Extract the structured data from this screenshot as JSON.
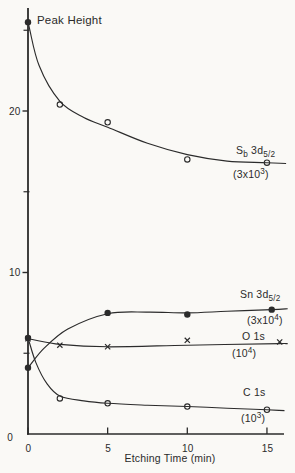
{
  "figure": {
    "background": "#faf9f6",
    "ink": "#2b2b2b"
  },
  "chart_data": {
    "type": "scatter",
    "title": "Peak Height",
    "ylabel": "Peak Height",
    "xlabel": "Etching Time (min)",
    "xlim": [
      0,
      16.3
    ],
    "ylim": [
      0,
      26.5
    ],
    "grid": false,
    "x_ticks": [
      {
        "v": 0,
        "label": "0"
      },
      {
        "v": 5,
        "label": "5"
      },
      {
        "v": 10,
        "label": "10"
      },
      {
        "v": 15,
        "label": "15"
      }
    ],
    "y_ticks": [
      {
        "v": 0,
        "label": "0"
      },
      {
        "v": 10,
        "label": "10"
      },
      {
        "v": 20,
        "label": "20"
      }
    ],
    "y_minor_ticks": [
      5,
      15,
      25
    ],
    "series": [
      {
        "id": "sb-3d52",
        "name": "Sb 3d5/2",
        "scale_factor": "(3x10^3)",
        "marker": "open-circle",
        "first_marker": "filled-circle",
        "x": [
          0,
          2,
          5,
          10,
          15
        ],
        "values": [
          25.5,
          20.4,
          19.3,
          17.0,
          16.8
        ],
        "curve_x": [
          0,
          0.7,
          2,
          3.5,
          5,
          7.5,
          10,
          12.5,
          15,
          16.2
        ],
        "curve_v": [
          25.5,
          22.8,
          20.6,
          19.6,
          19.0,
          18.0,
          17.3,
          16.9,
          16.8,
          16.75
        ],
        "label_parts": [
          {
            "t": "S"
          },
          {
            "t": "b",
            "m": "sub"
          },
          {
            "t": " 3d"
          },
          {
            "t": "5/2",
            "m": "sub"
          }
        ],
        "scale_parts": [
          {
            "t": "(3x10"
          },
          {
            "t": "3",
            "m": "sup"
          },
          {
            "t": ")"
          }
        ],
        "label_px": [
          236,
          154
        ],
        "scale_px": [
          233,
          178
        ]
      },
      {
        "id": "sn-3d52",
        "name": "Sn 3d5/2",
        "scale_factor": "(3x10^4)",
        "marker": "filled-circle",
        "x": [
          0,
          5,
          10,
          15
        ],
        "values": [
          4.1,
          7.5,
          7.4,
          7.7
        ],
        "marker_x_draw": [
          0,
          5,
          10,
          15.3
        ],
        "curve_x": [
          0,
          1,
          2.5,
          5,
          7.5,
          10,
          12.5,
          15.3,
          16.3
        ],
        "curve_v": [
          4.1,
          5.3,
          6.5,
          7.45,
          7.55,
          7.5,
          7.6,
          7.7,
          7.75
        ],
        "label_parts": [
          {
            "t": "Sn 3d"
          },
          {
            "t": "5/2",
            "m": "sub"
          }
        ],
        "scale_parts": [
          {
            "t": "(3x10"
          },
          {
            "t": "4",
            "m": "sup"
          },
          {
            "t": ")"
          }
        ],
        "label_px": [
          240,
          298
        ],
        "scale_px": [
          247,
          324
        ]
      },
      {
        "id": "o-1s",
        "name": "O 1s",
        "scale_factor": "(10^4)",
        "marker": "x-cross",
        "x": [
          0,
          2,
          5,
          10,
          15
        ],
        "values": [
          5.9,
          5.5,
          5.4,
          5.8,
          5.7
        ],
        "marker_x_draw": [
          0,
          2,
          5,
          10,
          15.8
        ],
        "curve_x": [
          0,
          2,
          5,
          10,
          15.8,
          16.3
        ],
        "curve_v": [
          5.9,
          5.55,
          5.4,
          5.5,
          5.6,
          5.6
        ],
        "label_parts": [
          {
            "t": "O 1s"
          }
        ],
        "scale_parts": [
          {
            "t": "(10"
          },
          {
            "t": "4",
            "m": "sup"
          },
          {
            "t": ")"
          }
        ],
        "label_px": [
          242,
          340
        ],
        "scale_px": [
          232,
          357
        ]
      },
      {
        "id": "c-1s",
        "name": "C 1s",
        "scale_factor": "(10^3)",
        "marker": "open-circle",
        "first_marker": "filled-circle",
        "x": [
          0,
          2,
          5,
          10,
          15
        ],
        "values": [
          5.95,
          2.2,
          1.9,
          1.7,
          1.5
        ],
        "curve_x": [
          0,
          0.5,
          1.2,
          2,
          3.5,
          5,
          7.5,
          10,
          12.5,
          15,
          16.1
        ],
        "curve_v": [
          5.95,
          4.4,
          3.1,
          2.35,
          2.05,
          1.9,
          1.78,
          1.7,
          1.6,
          1.5,
          1.45
        ],
        "label_parts": [
          {
            "t": "C 1s"
          }
        ],
        "scale_parts": [
          {
            "t": "(10"
          },
          {
            "t": "3",
            "m": "sup"
          },
          {
            "t": ")"
          }
        ],
        "label_px": [
          243,
          396
        ],
        "scale_px": [
          241,
          422
        ]
      }
    ]
  }
}
